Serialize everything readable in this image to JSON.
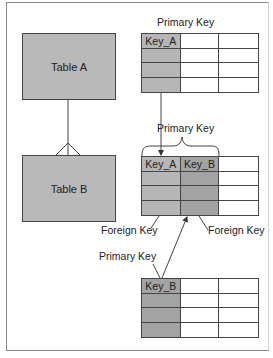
{
  "entities": {
    "table_a": "Table A",
    "table_b": "Table B"
  },
  "labels": {
    "primary_key_top": "Primary Key",
    "primary_key_middle": "Primary Key",
    "foreign_key_left": "Foreign Key",
    "foreign_key_right": "Foreign Key",
    "primary_key_bottom": "Primary Key"
  },
  "grids": {
    "top": {
      "headers": [
        "Key_A",
        "",
        ""
      ],
      "shaded_columns": [
        "a"
      ]
    },
    "middle": {
      "headers": [
        "Key_A",
        "Key_B",
        ""
      ],
      "shaded_columns": [
        "a",
        "b"
      ]
    },
    "bottom": {
      "headers": [
        "Key_B",
        "",
        ""
      ],
      "shaded_columns": [
        "b"
      ]
    }
  },
  "colors": {
    "entity_fill": "#b9b9b9",
    "key_a_fill": "#b6b6b6",
    "key_b_fill": "#a3a3a3",
    "line": "#444444"
  }
}
